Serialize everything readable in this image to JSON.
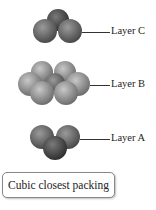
{
  "figure": {
    "layers": [
      {
        "id": "C",
        "label": "Layer C",
        "sphere_count": 3
      },
      {
        "id": "B",
        "label": "Layer B",
        "sphere_count": 7
      },
      {
        "id": "A",
        "label": "Layer A",
        "sphere_count": 3
      }
    ],
    "caption": "Cubic closest packing",
    "colors": {
      "dark_sphere": "#4a4a4a",
      "mid_sphere": "#7a7a7a",
      "light_sphere": "#a8a8a8"
    }
  }
}
